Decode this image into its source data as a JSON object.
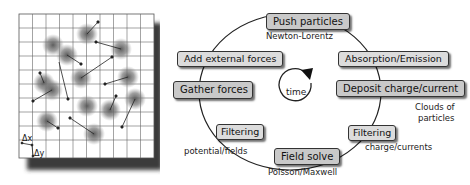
{
  "diagram": {
    "grid_panel": {
      "labels": {
        "dx": "Δx",
        "dy": "Δy"
      },
      "grid": {
        "columns": 10,
        "rows": 11
      },
      "particle_count": 15
    },
    "cycle": {
      "center_label": "time",
      "steps": [
        {
          "id": "push",
          "label": "Push particles",
          "sublabel": "Newton-Lorentz"
        },
        {
          "id": "absorption",
          "label": "Absorption/Emission"
        },
        {
          "id": "deposit",
          "label": "Deposit charge/current",
          "sublabel": "Clouds of particles"
        },
        {
          "id": "filter-charge",
          "label": "Filtering",
          "sublabel": "charge/currents"
        },
        {
          "id": "field-solve",
          "label": "Field solve",
          "sublabel": "Poisson/Maxwell"
        },
        {
          "id": "filter-fields",
          "label": "Filtering",
          "sublabel": "potential/fields"
        },
        {
          "id": "gather",
          "label": "Gather forces"
        },
        {
          "id": "external",
          "label": "Add external forces"
        }
      ],
      "clouds_label_line1": "Clouds of",
      "clouds_label_line2": "particles"
    }
  }
}
